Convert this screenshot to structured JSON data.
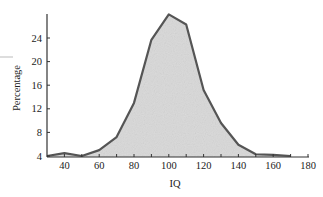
{
  "chart_data": {
    "type": "area",
    "title": "",
    "xlabel": "IQ",
    "ylabel": "Percentage",
    "x": [
      30,
      40,
      50,
      60,
      70,
      80,
      90,
      100,
      110,
      120,
      130,
      140,
      150,
      160,
      170
    ],
    "series": [
      {
        "name": "IQ distribution",
        "values": [
          4.0,
          4.5,
          4.0,
          5.0,
          7.2,
          13.0,
          23.7,
          28.0,
          26.3,
          15.2,
          9.6,
          5.9,
          4.3,
          4.2,
          4.0
        ]
      }
    ],
    "xlim": [
      30,
      180
    ],
    "ylim": [
      4,
      29
    ],
    "x_ticks": [
      40,
      60,
      80,
      100,
      120,
      140,
      160,
      180
    ],
    "x_minor_ticks": [
      50,
      70,
      90,
      110,
      130,
      150,
      170
    ],
    "y_ticks": [
      4,
      8,
      12,
      16,
      20,
      24
    ],
    "grid": false,
    "legend": null,
    "colors": {
      "fill": "#d9d9d9",
      "line": "#555555",
      "axis": "#333333"
    }
  }
}
